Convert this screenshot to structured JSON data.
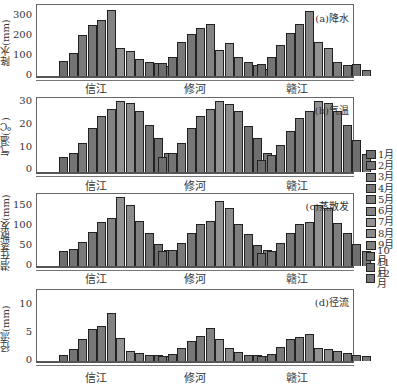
{
  "chart_data": [
    {
      "type": "bar",
      "title": "(a)降水",
      "xlabel": "",
      "ylabel": "降水(mm)",
      "ylim": [
        0,
        330
      ],
      "yticks": [
        0,
        100,
        200,
        300
      ],
      "categories": [
        "信江",
        "修河",
        "赣江"
      ],
      "months": [
        "1月",
        "2月",
        "3月",
        "4月",
        "5月",
        "6月",
        "7月",
        "8月",
        "9月",
        "10月",
        "11月",
        "12月"
      ],
      "series": [
        {
          "name": "信江",
          "values": [
            70,
            110,
            195,
            240,
            265,
            310,
            130,
            120,
            80,
            65,
            60,
            45
          ]
        },
        {
          "name": "修河",
          "values": [
            60,
            90,
            160,
            200,
            225,
            245,
            125,
            155,
            90,
            65,
            50,
            35
          ]
        },
        {
          "name": "赣江",
          "values": [
            55,
            90,
            145,
            205,
            245,
            305,
            160,
            130,
            65,
            50,
            55,
            30
          ]
        }
      ]
    },
    {
      "type": "bar",
      "title": "(b)气温",
      "xlabel": "",
      "ylabel": "气温(℃)",
      "ylim": [
        0,
        30
      ],
      "yticks": [
        0,
        10,
        20,
        30
      ],
      "categories": [
        "信江",
        "修河",
        "赣江"
      ],
      "months": [
        "1月",
        "2月",
        "3月",
        "4月",
        "5月",
        "6月",
        "7月",
        "8月",
        "9月",
        "10月",
        "11月",
        "12月"
      ],
      "series": [
        {
          "name": "信江",
          "values": [
            6,
            8,
            12,
            18,
            23,
            26,
            29,
            28.5,
            25,
            19.5,
            14,
            8
          ]
        },
        {
          "name": "修河",
          "values": [
            6,
            8,
            12,
            18,
            23,
            26,
            29,
            28,
            25,
            19,
            14,
            8
          ]
        },
        {
          "name": "赣江",
          "values": [
            5,
            7,
            11,
            17,
            22,
            25,
            29,
            28.5,
            25,
            19.5,
            13,
            7.5
          ]
        }
      ]
    },
    {
      "type": "bar",
      "title": "(c)蒸散发",
      "xlabel": "",
      "ylabel": "潜在蒸散发(mm)",
      "ylim": [
        0,
        170
      ],
      "yticks": [
        0,
        50,
        100,
        150
      ],
      "categories": [
        "信江",
        "修河",
        "赣江"
      ],
      "months": [
        "1月",
        "2月",
        "3月",
        "4月",
        "5月",
        "6月",
        "7月",
        "8月",
        "9月",
        "10月",
        "11月",
        "12月"
      ],
      "series": [
        {
          "name": "信江",
          "values": [
            35,
            40,
            58,
            82,
            105,
            115,
            165,
            145,
            107,
            80,
            52,
            38
          ]
        },
        {
          "name": "修河",
          "values": [
            35,
            38,
            55,
            80,
            100,
            108,
            155,
            140,
            100,
            77,
            50,
            38
          ]
        },
        {
          "name": "赣江",
          "values": [
            32,
            35,
            55,
            80,
            100,
            105,
            145,
            140,
            103,
            80,
            52,
            35
          ]
        }
      ]
    },
    {
      "type": "bar",
      "title": "(d)径流",
      "xlabel": "",
      "ylabel": "径流(mm)",
      "ylim": [
        0,
        12
      ],
      "yticks": [
        0,
        5,
        10
      ],
      "categories": [
        "信江",
        "修河",
        "赣江"
      ],
      "months": [
        "1月",
        "2月",
        "3月",
        "4月",
        "5月",
        "6月",
        "7月",
        "8月",
        "9月",
        "10月",
        "11月",
        "12月"
      ],
      "series": [
        {
          "name": "信江",
          "values": [
            1.0,
            2.0,
            3.8,
            5.5,
            6.0,
            8.3,
            4.0,
            1.7,
            1.4,
            1.0,
            1.0,
            0.9
          ]
        },
        {
          "name": "修河",
          "values": [
            0.8,
            1.2,
            2.2,
            3.5,
            4.3,
            5.7,
            3.8,
            2.2,
            1.5,
            1.0,
            1.0,
            0.8
          ]
        },
        {
          "name": "赣江",
          "values": [
            0.8,
            1.2,
            2.4,
            3.8,
            4.2,
            4.7,
            2.3,
            2.0,
            1.7,
            1.3,
            1.1,
            0.9
          ]
        }
      ]
    }
  ],
  "legend": {
    "items": [
      {
        "label": "1月",
        "color": "#6e6e6e"
      },
      {
        "label": "2月",
        "color": "#747474"
      },
      {
        "label": "3月",
        "color": "#7a7a7a"
      },
      {
        "label": "4月",
        "color": "#777777"
      },
      {
        "label": "5月",
        "color": "#7c7c7c"
      },
      {
        "label": "6月",
        "color": "#838383"
      },
      {
        "label": "7月",
        "color": "#939393"
      },
      {
        "label": "8月",
        "color": "#8c8c8c"
      },
      {
        "label": "9月",
        "color": "#7f7f7f"
      },
      {
        "label": "10月",
        "color": "#747474"
      },
      {
        "label": "11月",
        "color": "#6f6f6f"
      },
      {
        "label": "12月",
        "color": "#787878"
      }
    ]
  },
  "panels": {
    "a": {
      "title": "(a)降水",
      "ylabel": "降水(mm)",
      "ticks": [
        "300",
        "200",
        "100",
        "0"
      ],
      "cats": [
        "信江",
        "修河",
        "赣江"
      ]
    },
    "b": {
      "title": "(b)气温",
      "ylabel": "气温(℃)",
      "ticks": [
        "30",
        "20",
        "10",
        "0"
      ],
      "cats": [
        "信江",
        "修河",
        "赣江"
      ]
    },
    "c": {
      "title": "(c)蒸散发",
      "ylabel": "潜在蒸散发(mm)",
      "ticks": [
        "150",
        "100",
        "50",
        "0"
      ],
      "cats": [
        "信江",
        "修河",
        "赣江"
      ]
    },
    "d": {
      "title": "(d)径流",
      "ylabel": "径流(mm)",
      "ticks": [
        "10",
        "5",
        "0"
      ],
      "cats": [
        "信江",
        "修河",
        "赣江"
      ]
    }
  }
}
